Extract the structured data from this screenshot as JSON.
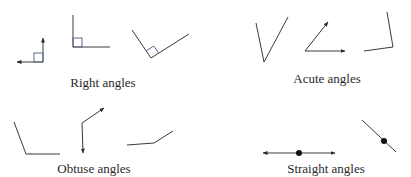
{
  "groups": [
    {
      "id": "right",
      "label": "Right angles",
      "count": 3
    },
    {
      "id": "acute",
      "label": "Acute angles",
      "count": 3
    },
    {
      "id": "obtuse",
      "label": "Obtuse angles",
      "count": 3
    },
    {
      "id": "straight",
      "label": "Straight angles",
      "count": 2
    }
  ],
  "colors": {
    "line": "#3a3a3a",
    "marker": "#5a6a8c",
    "text": "#2a2a2a",
    "background": "#ffffff"
  }
}
